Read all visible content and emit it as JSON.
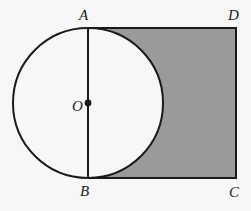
{
  "figure": {
    "background_color": "#f7f7f7",
    "stroke_color": "#1a1a1a",
    "shaded_color": "#9a9a9a",
    "unshaded_color": "#f7f7f7",
    "labels": {
      "A": "A",
      "B": "B",
      "C": "C",
      "D": "D",
      "O": "O"
    },
    "points": {
      "A": {
        "x": 88,
        "y": 28,
        "role": "square-top-left"
      },
      "B": {
        "x": 88,
        "y": 178,
        "role": "square-bottom-left"
      },
      "C": {
        "x": 236,
        "y": 178,
        "role": "square-bottom-right"
      },
      "D": {
        "x": 236,
        "y": 28,
        "role": "square-top-right"
      },
      "O": {
        "x": 88,
        "y": 103,
        "role": "circle-center"
      }
    },
    "square": {
      "left": 88,
      "top": 28,
      "width": 148,
      "height": 150,
      "stroke_width": 2
    },
    "circle": {
      "center_x": 88,
      "center_y": 103,
      "radius": 75,
      "stroke_width": 2,
      "fill": "#f7f7f7"
    },
    "segment_AB": {
      "x1": 88,
      "y1": 28,
      "x2": 88,
      "y2": 178,
      "stroke_width": 2
    },
    "center_dot": {
      "cx": 88,
      "cy": 103,
      "r": 3.4
    }
  }
}
